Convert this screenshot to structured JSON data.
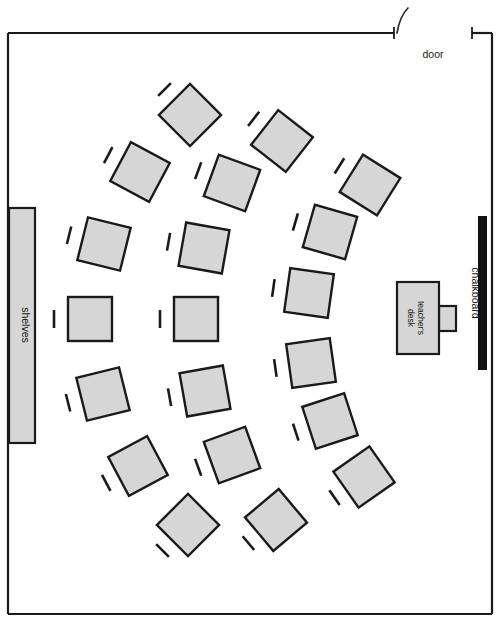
{
  "diagram": {
    "type": "classroom-floor-plan",
    "canvas": {
      "width": 502,
      "height": 626
    },
    "colors": {
      "desk_fill": "#d6d6d6",
      "outline": "#1a1a1a",
      "chalkboard": "#111111",
      "background": "#ffffff"
    }
  },
  "room": {
    "outline": {
      "x": 8,
      "y": 33,
      "width": 484,
      "height": 581
    },
    "walls": {
      "top_left_segment": {
        "x1": 8,
        "y1": 33,
        "x2": 394,
        "y2": 33
      },
      "top_right_segment": {
        "x1": 472,
        "y1": 33,
        "x2": 492,
        "y2": 33
      }
    }
  },
  "door": {
    "label": "door",
    "label_x": 433,
    "label_y": 58,
    "opening": {
      "x1": 394,
      "y1": 33,
      "x2": 472,
      "y2": 33
    },
    "tick_left_x": 394,
    "tick_right_x": 472,
    "swing_arc": "M 397 33 C 399 21 403 13 408 8"
  },
  "chalkboard": {
    "label": "chalkboard",
    "x": 478,
    "y": 216,
    "width": 9,
    "height": 154,
    "label_x": 472,
    "label_y": 293
  },
  "shelves": {
    "label": "shelves",
    "x": 9,
    "y": 208,
    "width": 26,
    "height": 235,
    "label_x": 22,
    "label_y": 325
  },
  "teacher_desk": {
    "label_line1": "teacher's",
    "label_line2": "desk",
    "desk": {
      "x": 397,
      "y": 282,
      "width": 42,
      "height": 72
    },
    "side_unit": {
      "x": 439,
      "y": 306,
      "width": 17,
      "height": 25
    },
    "label_x": 418,
    "label_y": 318
  },
  "student_desks": [
    {
      "id": "desk-01",
      "cx": 190,
      "cy": 115,
      "size": 44,
      "rotation": 45,
      "chair_angle": 45,
      "chair_offset": 36
    },
    {
      "id": "desk-02",
      "cx": 140,
      "cy": 172,
      "size": 44,
      "rotation": 28,
      "chair_angle": 28,
      "chair_offset": 36
    },
    {
      "id": "desk-03",
      "cx": 104,
      "cy": 244,
      "size": 44,
      "rotation": 14,
      "chair_angle": 14,
      "chair_offset": 36
    },
    {
      "id": "desk-04",
      "cx": 90,
      "cy": 319,
      "size": 44,
      "rotation": 0,
      "chair_angle": 0,
      "chair_offset": 36
    },
    {
      "id": "desk-05",
      "cx": 103,
      "cy": 394,
      "size": 44,
      "rotation": -14,
      "chair_angle": -14,
      "chair_offset": 36
    },
    {
      "id": "desk-06",
      "cx": 138,
      "cy": 466,
      "size": 44,
      "rotation": -28,
      "chair_angle": -28,
      "chair_offset": 36
    },
    {
      "id": "desk-07",
      "cx": 188,
      "cy": 525,
      "size": 44,
      "rotation": -45,
      "chair_angle": -45,
      "chair_offset": 36
    },
    {
      "id": "desk-08",
      "cx": 282,
      "cy": 141,
      "size": 44,
      "rotation": 38,
      "chair_angle": 38,
      "chair_offset": 36
    },
    {
      "id": "desk-09",
      "cx": 232,
      "cy": 183,
      "size": 44,
      "rotation": 20,
      "chair_angle": 20,
      "chair_offset": 36
    },
    {
      "id": "desk-10",
      "cx": 204,
      "cy": 248,
      "size": 44,
      "rotation": 10,
      "chair_angle": 10,
      "chair_offset": 36
    },
    {
      "id": "desk-11",
      "cx": 196,
      "cy": 319,
      "size": 44,
      "rotation": 0,
      "chair_angle": 0,
      "chair_offset": 36
    },
    {
      "id": "desk-12",
      "cx": 205,
      "cy": 391,
      "size": 44,
      "rotation": -10,
      "chair_angle": -10,
      "chair_offset": 36
    },
    {
      "id": "desk-13",
      "cx": 232,
      "cy": 455,
      "size": 44,
      "rotation": -20,
      "chair_angle": -20,
      "chair_offset": 36
    },
    {
      "id": "desk-14",
      "cx": 276,
      "cy": 520,
      "size": 44,
      "rotation": -40,
      "chair_angle": -40,
      "chair_offset": 36
    },
    {
      "id": "desk-15",
      "cx": 370,
      "cy": 185,
      "size": 44,
      "rotation": 32,
      "chair_angle": 32,
      "chair_offset": 36
    },
    {
      "id": "desk-16",
      "cx": 330,
      "cy": 232,
      "size": 44,
      "rotation": 16,
      "chair_angle": 16,
      "chair_offset": 36
    },
    {
      "id": "desk-17",
      "cx": 309,
      "cy": 293,
      "size": 44,
      "rotation": 8,
      "chair_angle": 8,
      "chair_offset": 36
    },
    {
      "id": "desk-18",
      "cx": 311,
      "cy": 363,
      "size": 44,
      "rotation": -8,
      "chair_angle": -8,
      "chair_offset": 36
    },
    {
      "id": "desk-19",
      "cx": 330,
      "cy": 421,
      "size": 44,
      "rotation": -18,
      "chair_angle": -18,
      "chair_offset": 36
    },
    {
      "id": "desk-20",
      "cx": 364,
      "cy": 477,
      "size": 44,
      "rotation": -35,
      "chair_angle": -35,
      "chair_offset": 36
    }
  ]
}
